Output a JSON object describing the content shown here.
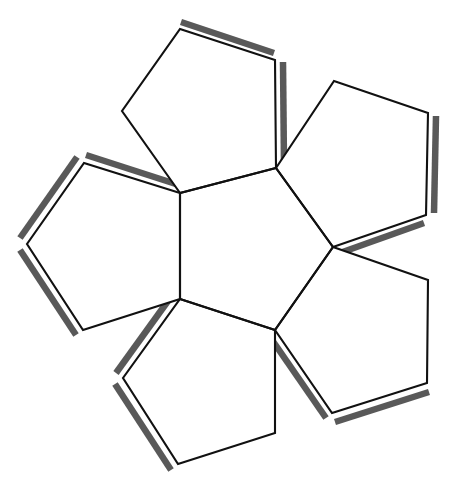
{
  "document": {
    "kind": "geometric-net-diagram",
    "title": "Pentagonal net diagram",
    "description": "Line drawing of a flat net made of six regular pentagons: one central pentagon surrounded by five pentagons, each attached along one edge, with shaded glue tabs along selected outer edges.",
    "background_color": "#ffffff",
    "labels": []
  },
  "style": {
    "outline_color": "#111111",
    "outline_width": 2.1,
    "tab_shadow_color": "#595959",
    "tab_shadow_light": "#6e6e6e",
    "tab_shadow_width": 6.5,
    "face_fill": "#ffffff"
  },
  "geometry": {
    "width": 455,
    "height": 492,
    "faces": [
      {
        "id": "center-pentagon",
        "name": "center-pentagon",
        "points": "180,193 276,168 333,247 275,330 180,299"
      },
      {
        "id": "top-pentagon",
        "name": "top-pentagon",
        "points": "180,193 122,111 180,29 275,60 276,168"
      },
      {
        "id": "upper-right-pentagon",
        "name": "upper-right-pentagon",
        "points": "276,168 334,81 428,113 426,215 333,247"
      },
      {
        "id": "lower-right-pentagon",
        "name": "lower-right-pentagon",
        "points": "333,247 428,280 427,383 332,413 275,330"
      },
      {
        "id": "bottom-pentagon",
        "name": "bottom-pentagon",
        "points": "275,330 275,433 178,464 123,378 180,299"
      },
      {
        "id": "left-pentagon",
        "name": "left-pentagon",
        "points": "180,299 83,330 27,244 84,163 180,193"
      }
    ],
    "tabs": [
      {
        "id": "tab-top-upper",
        "name": "tab-top-upper-edge",
        "from": "181,26",
        "to": "274,57",
        "offset": "0,-4"
      },
      {
        "id": "tab-top-right",
        "name": "tab-top-right-edge",
        "from": "279,62",
        "to": "280,166",
        "offset": "4,0"
      },
      {
        "id": "tab-upper-right-side",
        "name": "tab-upper-right-edge",
        "from": "432,116",
        "to": "430,213",
        "offset": "4,0"
      },
      {
        "id": "tab-upper-right-low",
        "name": "tab-upper-right-lower-edge",
        "from": "424,219",
        "to": "337,250",
        "offset": "0,4"
      },
      {
        "id": "tab-lower-right-low",
        "name": "tab-lower-right-lower-edge",
        "from": "429,388",
        "to": "335,418",
        "offset": "0,4"
      },
      {
        "id": "tab-lower-right-left",
        "name": "tab-lower-right-left-edge",
        "from": "330,416",
        "to": "274,335",
        "offset": "-4,2"
      },
      {
        "id": "tab-bottom-left",
        "name": "tab-bottom-left-edge",
        "from": "175,468",
        "to": "119,382",
        "offset": "-4,2"
      },
      {
        "id": "tab-bottom-upper-left",
        "name": "tab-bottom-upper-left-edge",
        "from": "120,375",
        "to": "177,296",
        "offset": "-4,-2"
      },
      {
        "id": "tab-left-lower",
        "name": "tab-left-lower-edge",
        "from": "80,333",
        "to": "24,248",
        "offset": "-4,2"
      },
      {
        "id": "tab-left-upper",
        "name": "tab-left-upper-edge",
        "from": "24,240",
        "to": "81,159",
        "offset": "-4,-2"
      },
      {
        "id": "tab-left-top",
        "name": "tab-left-top-edge",
        "from": "86,159",
        "to": "179,189",
        "offset": "0,-4"
      }
    ]
  }
}
